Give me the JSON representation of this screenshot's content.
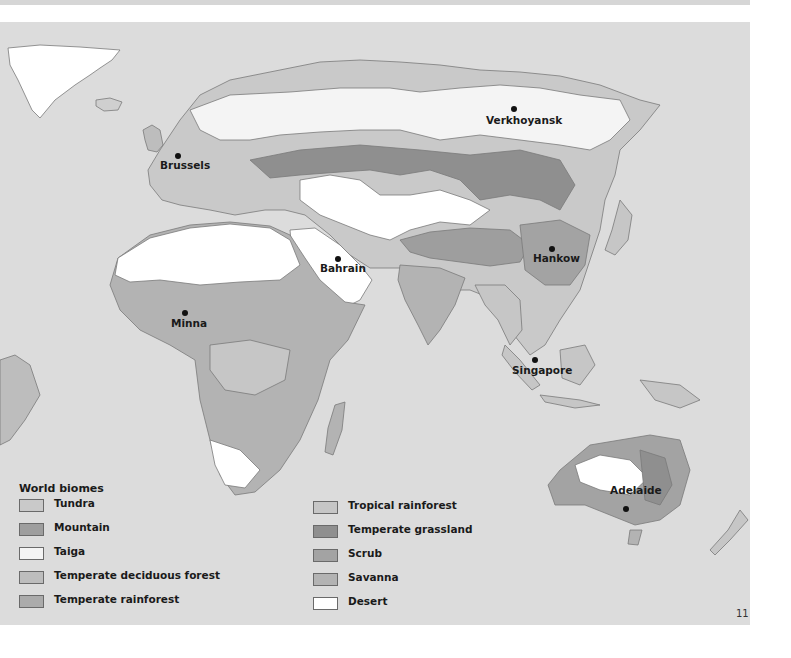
{
  "page": {
    "number": "11"
  },
  "colors": {
    "ocean": "#dcdcdc",
    "tundra": "#c9c9c9",
    "mountain": "#9e9e9e",
    "taiga": "#f4f4f4",
    "temperate_deciduous_forest": "#bdbdbd",
    "temperate_rainforest": "#ababab",
    "tropical_rainforest": "#c6c6c6",
    "temperate_grassland": "#8f8f8f",
    "scrub": "#a3a3a3",
    "savanna": "#b3b3b3",
    "desert": "#ffffff",
    "ice": "#ffffff"
  },
  "map": {
    "cities": [
      {
        "name": "Verkhoyansk",
        "dot_x": 514,
        "dot_y": 109,
        "label_x": 486,
        "label_y": 116
      },
      {
        "name": "Brussels",
        "dot_x": 178,
        "dot_y": 156,
        "label_x": 160,
        "label_y": 162
      },
      {
        "name": "Bahrain",
        "dot_x": 338,
        "dot_y": 259,
        "label_x": 320,
        "label_y": 265
      },
      {
        "name": "Hankow",
        "dot_x": 552,
        "dot_y": 249,
        "label_x": 533,
        "label_y": 255
      },
      {
        "name": "Minna",
        "dot_x": 185,
        "dot_y": 313,
        "label_x": 171,
        "label_y": 320
      },
      {
        "name": "Singapore",
        "dot_x": 535,
        "dot_y": 360,
        "label_x": 512,
        "label_y": 367
      },
      {
        "name": "Adelaide",
        "dot_x": 626,
        "dot_y": 509,
        "label_x": 610,
        "label_y": 487
      }
    ]
  },
  "legend": {
    "title": "World biomes",
    "left_column": [
      {
        "label": "Tundra",
        "color": "#c9c9c9"
      },
      {
        "label": "Mountain",
        "color": "#9e9e9e"
      },
      {
        "label": "Taiga",
        "color": "#f4f4f4"
      },
      {
        "label": "Temperate deciduous forest",
        "color": "#bdbdbd"
      },
      {
        "label": "Temperate rainforest",
        "color": "#ababab"
      }
    ],
    "right_column": [
      {
        "label": "Tropical rainforest",
        "color": "#c6c6c6"
      },
      {
        "label": "Temperate grassland",
        "color": "#8f8f8f"
      },
      {
        "label": "Scrub",
        "color": "#a3a3a3"
      },
      {
        "label": "Savanna",
        "color": "#b3b3b3"
      },
      {
        "label": "Desert",
        "color": "#ffffff"
      }
    ]
  }
}
